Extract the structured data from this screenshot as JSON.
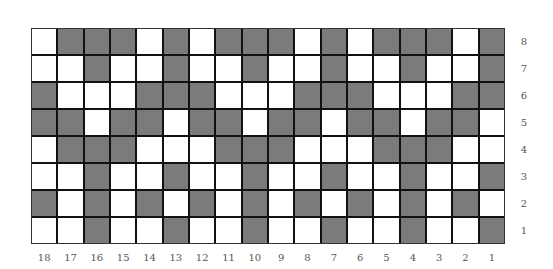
{
  "diagram": {
    "type": "weave-draft-grid",
    "fill_color": "#7b7b7b",
    "empty_color": "#ffffff",
    "border_color": "#111111",
    "columns": [
      "18",
      "17",
      "16",
      "15",
      "14",
      "13",
      "12",
      "11",
      "10",
      "9",
      "8",
      "7",
      "6",
      "5",
      "4",
      "3",
      "2",
      "1"
    ],
    "rows": [
      "8",
      "7",
      "6",
      "5",
      "4",
      "3",
      "2",
      "1"
    ],
    "cells": [
      [
        0,
        1,
        1,
        1,
        0,
        1,
        0,
        1,
        1,
        1,
        0,
        1,
        0,
        1,
        1,
        1,
        0,
        1
      ],
      [
        0,
        0,
        1,
        0,
        0,
        1,
        0,
        0,
        1,
        0,
        0,
        1,
        0,
        0,
        1,
        0,
        0,
        1
      ],
      [
        1,
        0,
        0,
        0,
        1,
        1,
        1,
        0,
        0,
        0,
        1,
        1,
        1,
        0,
        0,
        0,
        1,
        1
      ],
      [
        1,
        1,
        0,
        1,
        1,
        0,
        1,
        1,
        0,
        1,
        1,
        0,
        1,
        1,
        0,
        1,
        1,
        0
      ],
      [
        0,
        1,
        1,
        1,
        0,
        0,
        0,
        1,
        1,
        1,
        0,
        0,
        0,
        1,
        1,
        1,
        0,
        0
      ],
      [
        0,
        0,
        1,
        0,
        0,
        1,
        0,
        0,
        1,
        0,
        0,
        1,
        0,
        0,
        1,
        0,
        0,
        1
      ],
      [
        1,
        0,
        1,
        0,
        1,
        0,
        1,
        0,
        1,
        0,
        1,
        0,
        1,
        0,
        1,
        0,
        1,
        0
      ],
      [
        0,
        0,
        1,
        0,
        0,
        1,
        0,
        0,
        1,
        0,
        0,
        1,
        0,
        0,
        1,
        0,
        0,
        1
      ]
    ]
  }
}
